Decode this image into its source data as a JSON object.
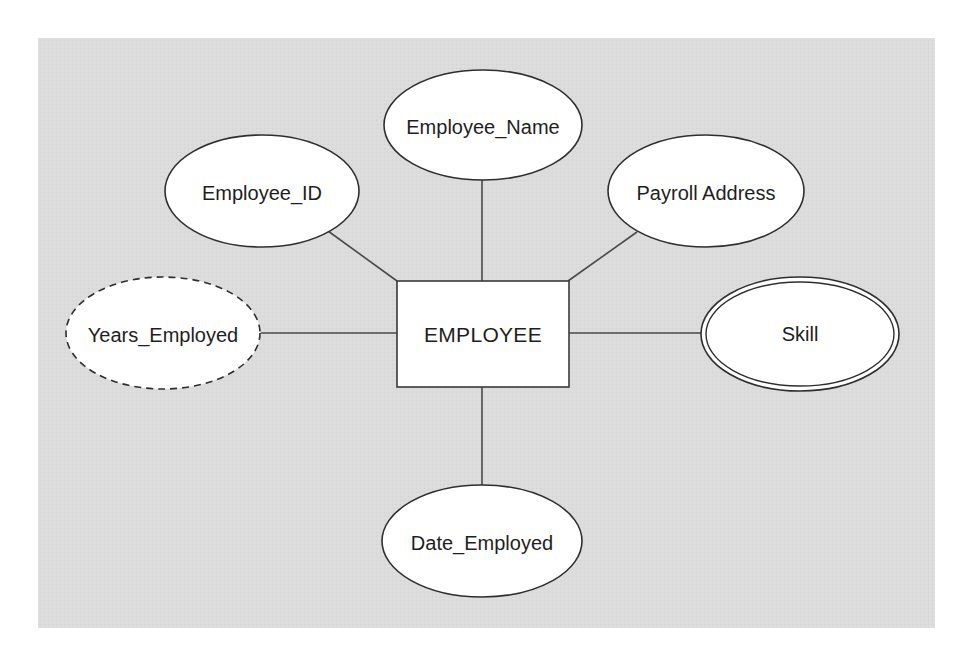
{
  "diagram": {
    "type": "entity-relationship",
    "background_color": "#dcdcdc",
    "entity": {
      "name": "EMPLOYEE",
      "shape": "rectangle"
    },
    "attributes": [
      {
        "id": "employee_name",
        "label": "Employee_Name",
        "kind": "simple",
        "shape": "ellipse"
      },
      {
        "id": "employee_id",
        "label": "Employee_ID",
        "kind": "simple",
        "shape": "ellipse"
      },
      {
        "id": "payroll_address",
        "label": "Payroll Address",
        "kind": "simple",
        "shape": "ellipse"
      },
      {
        "id": "years_employed",
        "label": "Years_Employed",
        "kind": "derived",
        "shape": "dashed-ellipse"
      },
      {
        "id": "skill",
        "label": "Skill",
        "kind": "multivalued",
        "shape": "double-ellipse"
      },
      {
        "id": "date_employed",
        "label": "Date_Employed",
        "kind": "simple",
        "shape": "ellipse"
      }
    ],
    "connections": [
      {
        "from": "EMPLOYEE",
        "to": "Employee_Name"
      },
      {
        "from": "EMPLOYEE",
        "to": "Employee_ID"
      },
      {
        "from": "EMPLOYEE",
        "to": "Payroll Address"
      },
      {
        "from": "EMPLOYEE",
        "to": "Years_Employed"
      },
      {
        "from": "EMPLOYEE",
        "to": "Skill"
      },
      {
        "from": "EMPLOYEE",
        "to": "Date_Employed"
      }
    ]
  }
}
